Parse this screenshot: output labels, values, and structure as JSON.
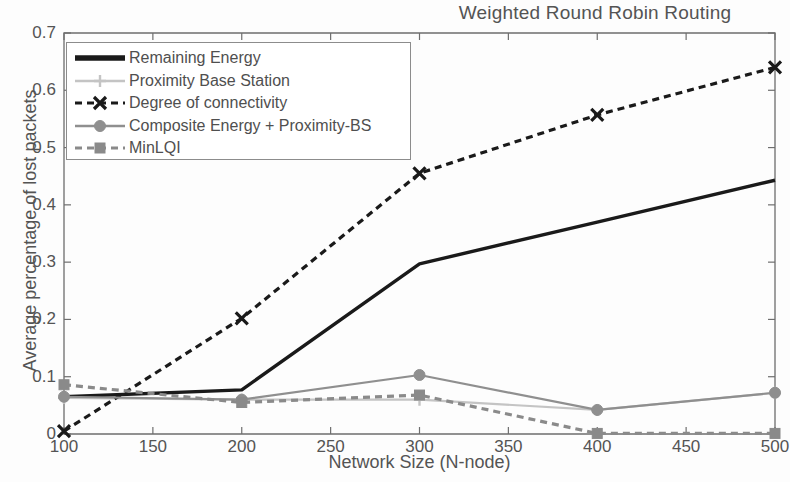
{
  "chart_data": {
    "type": "line",
    "title": "Weighted Round Robin Routing",
    "xlabel": "Network Size (N-node)",
    "ylabel": "Average percentage of lost packets",
    "x": [
      100,
      200,
      300,
      400,
      500
    ],
    "xlim": [
      100,
      500
    ],
    "ylim": [
      0,
      0.7
    ],
    "xticks": [
      "100",
      "150",
      "200",
      "250",
      "300",
      "350",
      "400",
      "450",
      "500"
    ],
    "xtick_values": [
      100,
      150,
      200,
      250,
      300,
      350,
      400,
      450,
      500
    ],
    "yticks": [
      "0",
      "0.1",
      "0.2",
      "0.3",
      "0.4",
      "0.5",
      "0.6",
      "0.7"
    ],
    "ytick_values": [
      0,
      0.1,
      0.2,
      0.3,
      0.4,
      0.5,
      0.6,
      0.7
    ],
    "grid": false,
    "legend_position": "upper left",
    "series": [
      {
        "name": "Remaining Energy",
        "color": "#1a1a1a",
        "linestyle": "solid",
        "marker": "none",
        "values": [
          0.065,
          0.077,
          0.297,
          0.37,
          0.443
        ]
      },
      {
        "name": "Proximity Base Station",
        "color": "#c4c4c4",
        "linestyle": "solid",
        "marker": "plus",
        "values": [
          0.063,
          0.06,
          0.06,
          0.042,
          0.072
        ]
      },
      {
        "name": "Degree of connectivity",
        "color": "#1a1a1a",
        "linestyle": "dashed",
        "marker": "x",
        "values": [
          0.005,
          0.202,
          0.455,
          0.557,
          0.64
        ]
      },
      {
        "name": "Composite Energy + Proximity-BS",
        "color": "#8f8f8f",
        "linestyle": "solid",
        "marker": "circle",
        "values": [
          0.065,
          0.06,
          0.103,
          0.042,
          0.072
        ]
      },
      {
        "name": "MinLQI",
        "color": "#8a8a8a",
        "linestyle": "dashed",
        "marker": "square",
        "values": [
          0.086,
          0.055,
          0.068,
          0.001,
          0.001
        ]
      }
    ]
  },
  "axes": {
    "plot_left": 64,
    "plot_right": 775,
    "plot_top": 33,
    "plot_bottom": 434
  }
}
